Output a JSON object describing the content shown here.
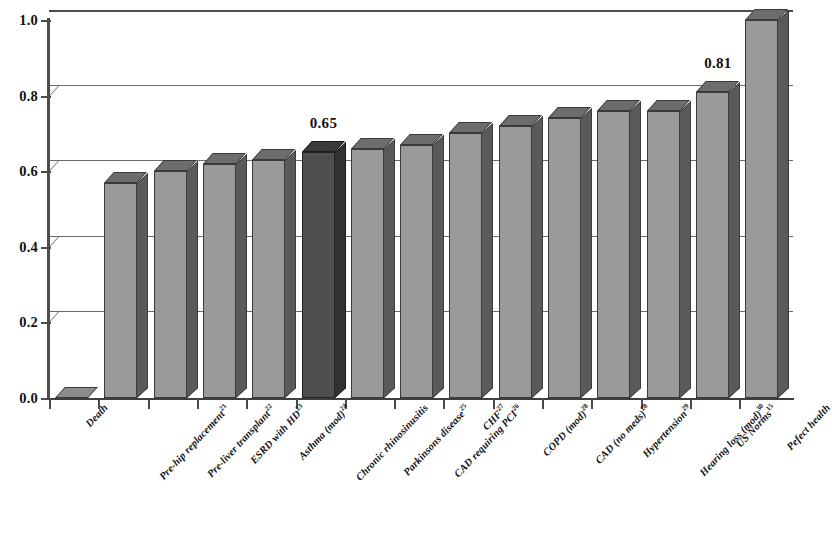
{
  "chart_data": {
    "type": "bar",
    "title": "",
    "subtitle": "",
    "xlabel": "",
    "ylabel": "",
    "ylim": [
      0.0,
      1.0
    ],
    "grid": true,
    "legend": "none",
    "orientation": "vertical-3d",
    "y_ticks": [
      "0.0",
      "0.2",
      "0.4",
      "0.6",
      "0.8",
      "1.0"
    ],
    "y_tick_values": [
      0.0,
      0.2,
      0.4,
      0.6,
      0.8,
      1.0
    ],
    "categories": [
      "Death",
      "Pre-hip replacement",
      "Pre-liver transplant",
      "ESRD with HD",
      "Asthma (mod)",
      "Chronic rhinosinusitis",
      "Parkinsons disease",
      "CAD requiring PCI",
      "CHF",
      "COPD (mod)",
      "CAD (no meds)",
      "Hypertension",
      "Hearing loss (mod)",
      "US Norms",
      "Pefect health"
    ],
    "category_superscripts": [
      "",
      "21",
      "22",
      "23",
      "24",
      "",
      "25",
      "26",
      "27",
      "28",
      "28",
      "29",
      "30",
      "15",
      ""
    ],
    "values": [
      0.0,
      0.57,
      0.6,
      0.62,
      0.63,
      0.65,
      0.66,
      0.67,
      0.7,
      0.72,
      0.74,
      0.76,
      0.76,
      0.81,
      1.0
    ],
    "highlighted_index": 5,
    "annotations": [
      {
        "index": 5,
        "text": "0.65"
      },
      {
        "index": 13,
        "text": "0.81"
      }
    ],
    "colors": {
      "bar_face": "#9a9a9a",
      "bar_side": "#5a5a5a",
      "bar_top": "#6d6d6d",
      "bar_face_highlight": "#4f4f4f",
      "bar_side_highlight": "#313131",
      "bar_top_highlight": "#3a3a3a",
      "axis": "#3f3f3f",
      "gridline": "#6b6b6b",
      "text": "#121212",
      "background": "#ffffff"
    }
  }
}
